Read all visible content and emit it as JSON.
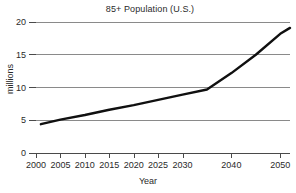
{
  "chart_data": {
    "type": "line",
    "title": "85+ Population (U.S.)",
    "xlabel": "Year",
    "ylabel": "millions",
    "xlim": [
      2000,
      2052
    ],
    "ylim": [
      0,
      20
    ],
    "grid": true,
    "grid_axis": "y",
    "legend": "none",
    "line_color": "#101010",
    "grid_color": "#8a8a8a",
    "axis_color": "#4a4a4a",
    "ytick_labels": [
      "0",
      "5",
      "10",
      "15",
      "20"
    ],
    "ytick_values": [
      0,
      5,
      10,
      15,
      20
    ],
    "xtick_labels": [
      "2000",
      "2005",
      "2010",
      "2015",
      "2020",
      "2025",
      "2030",
      "2040",
      "2050"
    ],
    "xtick_values": [
      2000,
      2005,
      2010,
      2015,
      2020,
      2025,
      2030,
      2040,
      2050
    ],
    "series": [
      {
        "name": "85+ Population",
        "units": "millions",
        "x": [
          2001,
          2005,
          2010,
          2015,
          2020,
          2025,
          2030,
          2035,
          2040,
          2045,
          2050,
          2052
        ],
        "values": [
          4.4,
          5.1,
          5.8,
          6.6,
          7.3,
          8.1,
          8.9,
          9.7,
          12.2,
          15.0,
          18.2,
          19.1
        ]
      }
    ]
  },
  "figure": {
    "title": "85+ Population (U.S.)",
    "xlabel": "Year",
    "ylabel": "millions"
  }
}
